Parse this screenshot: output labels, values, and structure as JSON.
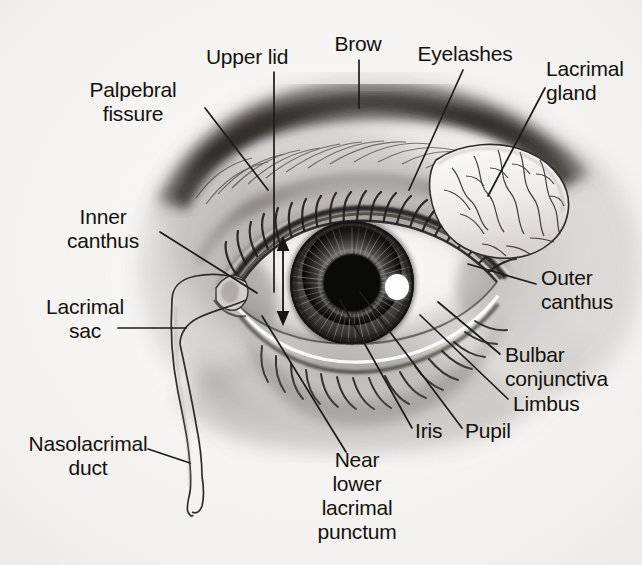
{
  "figure": {
    "type": "labeled anatomical illustration",
    "background_color": "#f4f3f1",
    "text_color": "#14120f",
    "line_color": "#1a1a1a"
  },
  "labels": [
    {
      "id": "palpebral-fissure",
      "text": "Palpebral\nfissure",
      "align": "center",
      "x": 133,
      "y": 78
    },
    {
      "id": "upper-lid",
      "text": "Upper lid",
      "align": "center",
      "x": 247,
      "y": 45
    },
    {
      "id": "brow",
      "text": "Brow",
      "align": "center",
      "x": 358,
      "y": 32
    },
    {
      "id": "eyelashes",
      "text": "Eyelashes",
      "align": "center",
      "x": 465,
      "y": 42
    },
    {
      "id": "lacrimal-gland",
      "text": "Lacrimal\ngland",
      "align": "left",
      "x": 546,
      "y": 57
    },
    {
      "id": "inner-canthus",
      "text": "Inner\ncanthus",
      "align": "center",
      "x": 103,
      "y": 205
    },
    {
      "id": "lacrimal-sac",
      "text": "Lacrimal\nsac",
      "align": "center",
      "x": 85,
      "y": 295
    },
    {
      "id": "nasolacrimal-duct",
      "text": "Nasolacrimal\nduct",
      "align": "center",
      "x": 88,
      "y": 432
    },
    {
      "id": "outer-canthus",
      "text": "Outer\ncanthus",
      "align": "left",
      "x": 541,
      "y": 266
    },
    {
      "id": "bulbar-conjunctiva",
      "text": "Bulbar\nconjunctiva",
      "align": "left",
      "x": 505,
      "y": 343
    },
    {
      "id": "limbus",
      "text": "Limbus",
      "align": "left",
      "x": 513,
      "y": 392
    },
    {
      "id": "pupil",
      "text": "Pupil",
      "align": "left",
      "x": 465,
      "y": 419
    },
    {
      "id": "iris",
      "text": "Iris",
      "align": "left",
      "x": 415,
      "y": 419
    },
    {
      "id": "near-lower-lacrimal-punctum",
      "text": "Near\nlower\nlacrimal\npunctum",
      "align": "center",
      "x": 357,
      "y": 448
    }
  ],
  "structures": [
    "brow",
    "upper lid",
    "eyelashes",
    "lacrimal gland",
    "palpebral fissure",
    "inner canthus",
    "outer canthus",
    "lacrimal sac",
    "nasolacrimal duct",
    "bulbar conjunctiva",
    "limbus",
    "iris",
    "pupil",
    "near lower lacrimal punctum"
  ]
}
